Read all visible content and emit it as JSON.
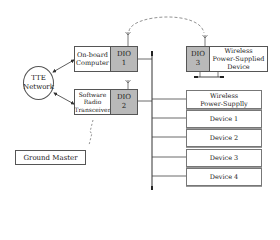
{
  "diagram": {
    "nodes": {
      "tte_network": "TTE\nNetwork",
      "onboard_computer": "On-board\nComputer",
      "dio1": "DIO\n1",
      "software_radio": "Software\nRadio\nTransceiver",
      "dio2": "DIO\n2",
      "dio3": "DIO\n3",
      "wireless_device": "Wireless\nPower-Supplied\nDevice",
      "wireless_supply": "Wireless\nPower-Supplly",
      "devices": [
        "Device 1",
        "Device 2",
        "Device 3",
        "Device 4"
      ],
      "ground_master": "Ground Master"
    },
    "colors": {
      "dio_fill": "#b9b9b9",
      "line": "#444444",
      "dashed": "#777777"
    }
  }
}
